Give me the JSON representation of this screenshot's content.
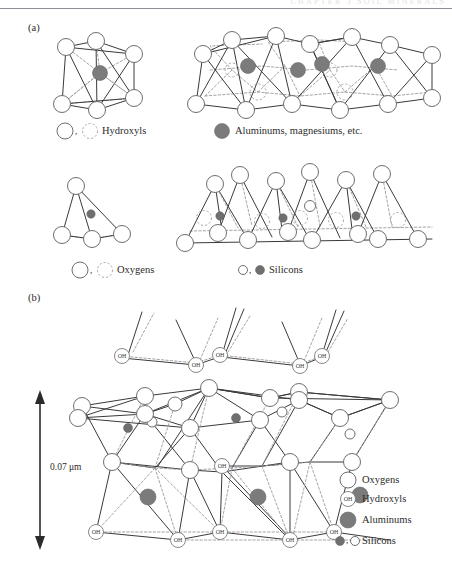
{
  "figure": {
    "header_ghost_text": "CHAPTER 3  SOIL MINERALS",
    "panels": [
      {
        "id": "a",
        "label": "(a)"
      },
      {
        "id": "b",
        "label": "(b)"
      }
    ]
  },
  "panel_a": {
    "label": "(a)",
    "row1": {
      "unit_caption": "single octahedral unit",
      "sheet_caption": "octahedral sheet",
      "legend": [
        {
          "key": "hydroxyls",
          "text": "Hydroxyls",
          "separator": ",",
          "markers": [
            "circle-open",
            "circle-dashed"
          ]
        },
        {
          "key": "aluminums-magnesiums",
          "text": "Aluminums, magnesiums, etc.",
          "markers": [
            "circle-filled-gray"
          ]
        }
      ]
    },
    "row2": {
      "unit_caption": "single tetrahedral unit",
      "sheet_caption": "tetrahedral (silica) sheet",
      "legend": [
        {
          "key": "oxygens",
          "text": "Oxygens",
          "separator": ",",
          "markers": [
            "circle-open",
            "circle-dashed"
          ]
        },
        {
          "key": "silicons",
          "text": "Silicons",
          "separator": ",",
          "markers": [
            "circle-small-open",
            "circle-small-filled"
          ]
        }
      ]
    }
  },
  "panel_b": {
    "label": "(b)",
    "dimension": {
      "value": "0.07",
      "unit": "μm",
      "text": "0.07 μm",
      "arrow": "double-headed-vertical"
    },
    "oh_node_label": "OH",
    "legend": [
      {
        "key": "oxygens",
        "text": "Oxygens",
        "marker": "circle-open"
      },
      {
        "key": "hydroxyls",
        "text": "Hydroxyls",
        "marker": "circle-oh"
      },
      {
        "key": "aluminums",
        "text": "Aluminums",
        "marker": "circle-filled-gray"
      },
      {
        "key": "silicons",
        "text": "Silicons",
        "marker": "circle-small-filled-open",
        "separator": ","
      }
    ]
  },
  "colors": {
    "cation_gray": "#7b7b7b",
    "outline_gray": "#6e6e72",
    "edge_solid": "#3a3a3a",
    "edge_dashed": "#9a9a9f",
    "text": "#2b2b2b",
    "rule": "#8e8e96",
    "background": "#ffffff"
  }
}
